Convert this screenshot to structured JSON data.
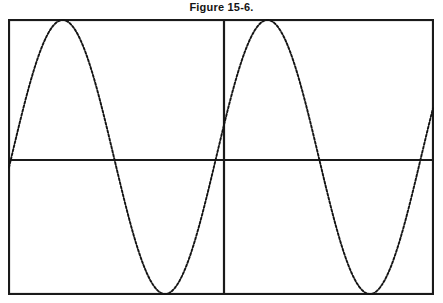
{
  "figure": {
    "title": "Figure 15-6.",
    "caption_position": "top-center"
  },
  "colors": {
    "background": "#ffffff",
    "frame": "#1a1a1a",
    "axis": "#1a1a1a",
    "curve": "#141414"
  },
  "chart_data": {
    "type": "line",
    "title": "Figure 15-6.",
    "subtitle": "",
    "xlabel": "",
    "ylabel": "",
    "grid": false,
    "legend": null,
    "legend_position": "none",
    "axis_style": {
      "frame": "full-rectangle-border",
      "horizontal_axis_y": 0,
      "vertical_axis_x": 1.0,
      "ticks": false,
      "tick_labels": false
    },
    "xlim": [
      0,
      2.07
    ],
    "ylim": [
      -1,
      1
    ],
    "x_unit": "cycles",
    "series": [
      {
        "name": "sine wave",
        "line_style": "dotted",
        "line_width": 1.6,
        "color": "#141414",
        "function": "y = sin(2*pi*x)",
        "cycles": 2,
        "amplitude": 1,
        "phase_offset_cycles": -0.012,
        "x": [
          0.0,
          0.05,
          0.1,
          0.15,
          0.2,
          0.25,
          0.3,
          0.35,
          0.4,
          0.45,
          0.5,
          0.55,
          0.6,
          0.65,
          0.7,
          0.75,
          0.8,
          0.85,
          0.9,
          0.95,
          1.0,
          1.05,
          1.1,
          1.15,
          1.2,
          1.25,
          1.3,
          1.35,
          1.4,
          1.45,
          1.5,
          1.55,
          1.6,
          1.65,
          1.7,
          1.75,
          1.8,
          1.85,
          1.9,
          1.95,
          2.0,
          2.05
        ],
        "y": [
          0.02,
          0.33,
          0.6,
          0.82,
          0.95,
          1.0,
          0.95,
          0.82,
          0.6,
          0.33,
          0.02,
          -0.29,
          -0.57,
          -0.8,
          -0.94,
          -1.0,
          -0.96,
          -0.84,
          -0.63,
          -0.36,
          -0.05,
          0.26,
          0.55,
          0.78,
          0.93,
          1.0,
          0.97,
          0.86,
          0.66,
          0.39,
          0.09,
          -0.23,
          -0.52,
          -0.76,
          -0.92,
          -1.0,
          -0.98,
          -0.88,
          -0.69,
          -0.43,
          -0.13,
          0.18
        ],
        "key_points": {
          "peaks_x": [
            0.25,
            1.25
          ],
          "troughs_x": [
            0.75,
            1.75
          ],
          "zero_crossings_x": [
            0.0,
            0.5,
            1.0,
            1.5,
            2.0
          ]
        }
      }
    ]
  }
}
